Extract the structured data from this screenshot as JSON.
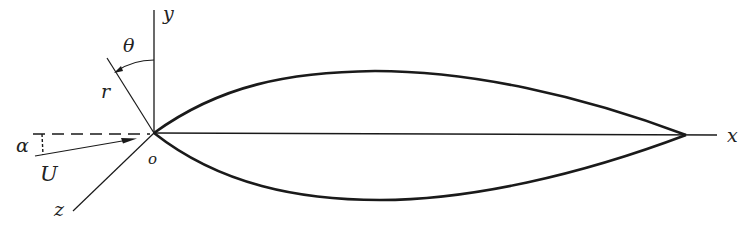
{
  "figure": {
    "labels": {
      "x_axis": "x",
      "y_axis": "y",
      "z_axis": "z",
      "origin": "o",
      "radius": "r",
      "theta": "θ",
      "alpha": "α",
      "velocity": "U"
    },
    "colors": {
      "stroke": "#1a1a1a",
      "background": "#ffffff"
    }
  }
}
